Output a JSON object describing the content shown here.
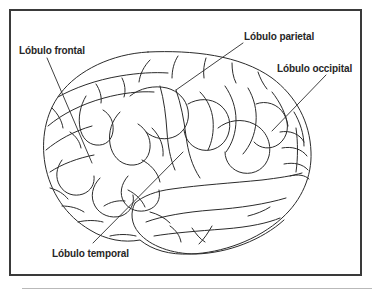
{
  "figure": {
    "kind": "anatomical-diagram",
    "language": "es",
    "line_color": "#2b2b2b",
    "frame_color": "#3a3a3a",
    "text_color": "#262626",
    "background_color": "#ffffff"
  },
  "labels": [
    {
      "id": "frontal",
      "text": "Lóbulo frontal",
      "leader": {
        "x1": 47,
        "y1": 58,
        "x2": 92,
        "y2": 163
      }
    },
    {
      "id": "parietal",
      "text": "Lóbulo parietal",
      "leader": {
        "x1": 243,
        "y1": 43,
        "x2": 176,
        "y2": 90
      }
    },
    {
      "id": "occipital",
      "text": "Lóbulo occipital",
      "leader": {
        "x1": 326,
        "y1": 75,
        "x2": 272,
        "y2": 131
      }
    },
    {
      "id": "temporal",
      "text": "Lóbulo temporal",
      "leader": {
        "x1": 93,
        "y1": 243,
        "x2": 183,
        "y2": 152
      }
    }
  ]
}
